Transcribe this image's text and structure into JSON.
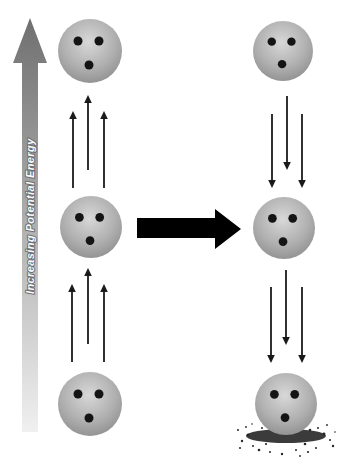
{
  "colors": {
    "background": "#ffffff",
    "axis_gradient_top": "#6f6f6f",
    "axis_gradient_bottom": "#f0f0f0",
    "axis_label_fill": "#fafafa",
    "axis_label_outline": "#6e6e6e",
    "ball_highlight": "#d8d8d8",
    "ball_mid": "#b0b0b0",
    "ball_edge": "#868686",
    "hole": "#141414",
    "motion_arrow": "#1a1a1a",
    "process_arrow": "#000000",
    "dust": "#262626"
  },
  "diagram": {
    "axis_label": "Increasing Potential Energy",
    "axis_direction": "up",
    "process_arrow_direction": "right",
    "ball_holes_offsets": [
      [
        -12,
        -10
      ],
      [
        9,
        -10
      ],
      [
        -1,
        14
      ]
    ],
    "hole_radius": 4.5,
    "left_column": {
      "state": "ball-raised-upward",
      "arrow_direction": "up",
      "balls": [
        {
          "cx": 90,
          "cy": 51,
          "r": 32
        },
        {
          "cx": 91,
          "cy": 227,
          "r": 31
        },
        {
          "cx": 90,
          "cy": 404,
          "r": 32
        }
      ],
      "arrow_groups": [
        [
          {
            "x": 73,
            "tail": 188,
            "tip": 111
          },
          {
            "x": 88,
            "tail": 170,
            "tip": 95
          },
          {
            "x": 104,
            "tail": 188,
            "tip": 111
          }
        ],
        [
          {
            "x": 72,
            "tail": 362,
            "tip": 284
          },
          {
            "x": 88,
            "tail": 344,
            "tip": 268
          },
          {
            "x": 104,
            "tail": 362,
            "tip": 284
          }
        ]
      ]
    },
    "right_column": {
      "state": "ball-falling-downward",
      "arrow_direction": "down",
      "balls": [
        {
          "cx": 283,
          "cy": 51,
          "r": 30
        },
        {
          "cx": 284,
          "cy": 228,
          "r": 31
        },
        {
          "cx": 286,
          "cy": 404,
          "r": 31
        }
      ],
      "arrow_groups": [
        [
          {
            "x": 272,
            "tail": 114,
            "tip": 188
          },
          {
            "x": 287,
            "tail": 96,
            "tip": 170
          },
          {
            "x": 302,
            "tail": 114,
            "tip": 188
          }
        ],
        [
          {
            "x": 271,
            "tail": 287,
            "tip": 363
          },
          {
            "x": 286,
            "tail": 270,
            "tip": 345
          },
          {
            "x": 302,
            "tail": 287,
            "tip": 363
          }
        ]
      ],
      "impact_dust": {
        "cx": 286,
        "cy": 436,
        "speckles": [
          [
            242,
            441,
            1.2
          ],
          [
            248,
            435,
            1.5
          ],
          [
            253,
            446,
            1.0
          ],
          [
            259,
            450,
            1.3
          ],
          [
            238,
            430,
            1.0
          ],
          [
            246,
            427,
            0.9
          ],
          [
            318,
            428,
            1.0
          ],
          [
            324,
            434,
            1.4
          ],
          [
            330,
            440,
            1.0
          ],
          [
            333,
            446,
            1.2
          ],
          [
            316,
            448,
            1.0
          ],
          [
            308,
            452,
            1.1
          ],
          [
            270,
            452,
            1.0
          ],
          [
            282,
            454,
            1.2
          ],
          [
            296,
            450,
            1.0
          ],
          [
            262,
            428,
            1.0
          ],
          [
            310,
            430,
            1.3
          ],
          [
            252,
            424,
            0.8
          ],
          [
            327,
            425,
            0.9
          ],
          [
            240,
            448,
            1.0
          ],
          [
            335,
            432,
            0.8
          ],
          [
            300,
            456,
            0.9
          ],
          [
            266,
            444,
            1.1
          ],
          [
            305,
            444,
            1.3
          ]
        ]
      }
    }
  }
}
